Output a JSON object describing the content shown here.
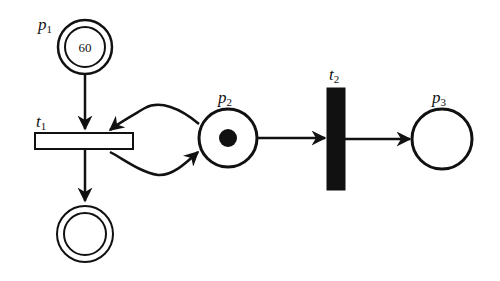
{
  "diagram": {
    "type": "petri-net",
    "places": [
      {
        "id": "p1",
        "label": "p",
        "subscript": "1",
        "tokens_text": "60",
        "style": "double-circle"
      },
      {
        "id": "p2",
        "label": "p",
        "subscript": "2",
        "tokens": 1,
        "style": "circle"
      },
      {
        "id": "p3",
        "label": "p",
        "subscript": "3",
        "tokens": 0,
        "style": "circle"
      },
      {
        "id": "p_out",
        "label": "",
        "tokens": 0,
        "style": "double-circle"
      }
    ],
    "transitions": [
      {
        "id": "t1",
        "label": "t",
        "subscript": "1",
        "style": "hollow-horizontal-bar"
      },
      {
        "id": "t2",
        "label": "t",
        "subscript": "2",
        "style": "filled-vertical-bar"
      }
    ],
    "arcs": [
      {
        "from": "p1",
        "to": "t1"
      },
      {
        "from": "t1",
        "to": "p_out"
      },
      {
        "from": "t1",
        "to": "p2"
      },
      {
        "from": "p2",
        "to": "t1"
      },
      {
        "from": "p2",
        "to": "t2"
      },
      {
        "from": "t2",
        "to": "p3"
      }
    ],
    "colors": {
      "stroke": "#111111",
      "fill": "#ffffff",
      "token": "#111111"
    }
  }
}
